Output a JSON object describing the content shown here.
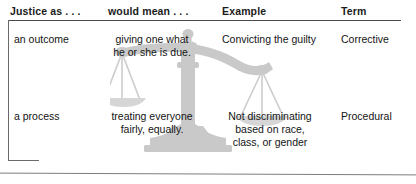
{
  "table": {
    "headers": [
      {
        "label": "Justice as . . ."
      },
      {
        "label": "would mean . . ."
      },
      {
        "label": "Example"
      },
      {
        "label": "Term"
      }
    ],
    "rows": [
      {
        "justice_as": "an outcome",
        "would_mean": "giving one what\nhe or she is due.",
        "example": "Convicting the guilty",
        "term": "Corrective"
      },
      {
        "justice_as": "a process",
        "would_mean": "treating everyone\nfairly, equally.",
        "example": "Not discriminating\nbased on race,\nclass, or gender",
        "term": "Procedural"
      }
    ]
  },
  "decoration": {
    "watermark_name": "scales-of-justice",
    "watermark_color": "#c9c9c9",
    "watermark_shadow_color": "#d9d9d9"
  },
  "colors": {
    "header_text": "#1b1b1b",
    "body_text": "#141414",
    "rule": "#4a4a4a",
    "background": "#ffffff"
  }
}
